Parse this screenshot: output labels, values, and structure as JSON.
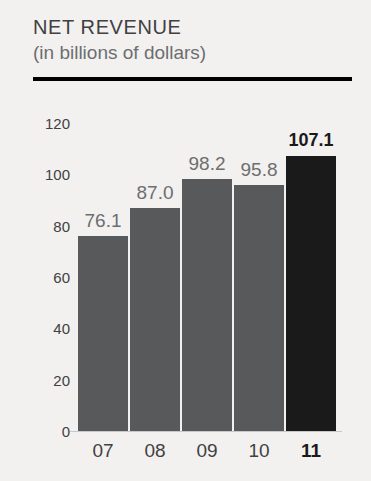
{
  "header": {
    "title": "NET REVENUE",
    "subtitle": "(in billions of dollars)"
  },
  "colors": {
    "background": "#f2f1ef",
    "bar": "#58595b",
    "bar_highlight": "#1a1a1a",
    "title": "#414042",
    "subtitle": "#6d6e70",
    "rule": "#000000",
    "value_label": "#6d6e70",
    "value_label_highlight": "#1a1a1a"
  },
  "chart_data": {
    "type": "bar",
    "title": "NET REVENUE",
    "subtitle": "(in billions of dollars)",
    "xlabel": "",
    "ylabel": "",
    "categories": [
      "07",
      "08",
      "09",
      "10",
      "11"
    ],
    "values": [
      76.1,
      87.0,
      98.2,
      95.8,
      107.1
    ],
    "value_labels": [
      "76.1",
      "87.0",
      "98.2",
      "95.8",
      "107.1"
    ],
    "highlight_index": 4,
    "ylim": [
      0,
      120
    ],
    "yticks": [
      0,
      20,
      40,
      60,
      80,
      100,
      120
    ],
    "ytick_labels": [
      "0",
      "20",
      "40",
      "60",
      "80",
      "100",
      "120"
    ],
    "grid": false,
    "legend": false
  }
}
